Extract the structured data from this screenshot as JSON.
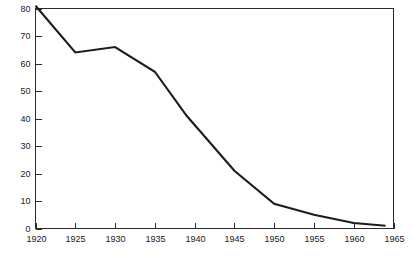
{
  "chart_data": {
    "type": "line",
    "title": "",
    "subtitle": "",
    "xlabel": "",
    "ylabel": "",
    "xlim": [
      1920,
      1965
    ],
    "ylim": [
      0,
      80
    ],
    "grid": false,
    "legend": null,
    "x_ticks": [
      1920,
      1925,
      1930,
      1935,
      1940,
      1945,
      1950,
      1955,
      1960,
      1965
    ],
    "x_tick_labels": [
      "1920",
      "1925",
      "1930",
      "1935",
      "1940",
      "1945",
      "1950",
      "1955",
      "1960",
      "1965"
    ],
    "y_ticks": [
      0,
      10,
      20,
      30,
      40,
      50,
      60,
      70,
      80
    ],
    "y_tick_labels": [
      "0",
      "10",
      "20",
      "30",
      "40",
      "50",
      "60",
      "70",
      "80"
    ],
    "series": [
      {
        "name": "series-1",
        "color": "#1c1c1c",
        "x": [
          1920,
          1925,
          1930,
          1935,
          1939,
          1945,
          1950,
          1955,
          1960,
          1964
        ],
        "values": [
          81,
          64,
          66,
          57,
          41,
          21,
          9,
          5,
          2,
          1
        ]
      }
    ]
  },
  "figure": {
    "background_color": "#ffffff",
    "axis_color": "#2b2b2b",
    "line_color": "#1c1c1c"
  }
}
